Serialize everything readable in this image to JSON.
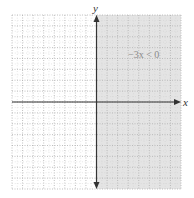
{
  "chart_data": {
    "type": "area",
    "title": "",
    "annotation": "−3x < 0",
    "xlabel": "x",
    "ylabel": "y",
    "xlim": [
      -8,
      8
    ],
    "ylim": [
      -8,
      8
    ],
    "grid": true,
    "grid_style": "dotted",
    "shaded_region": {
      "condition": "x > 0",
      "x_from": 0,
      "x_to": 8,
      "color": "#e6e6e6"
    },
    "boundary_line": {
      "equation": "x = 0",
      "style": "solid"
    }
  },
  "labels": {
    "x_axis": "x",
    "y_axis": "y",
    "inequality": "−3x < 0"
  },
  "colors": {
    "shade": "#e4e4e4",
    "grid": "#b0b0b0",
    "axis": "#333333",
    "text": "#888888"
  }
}
